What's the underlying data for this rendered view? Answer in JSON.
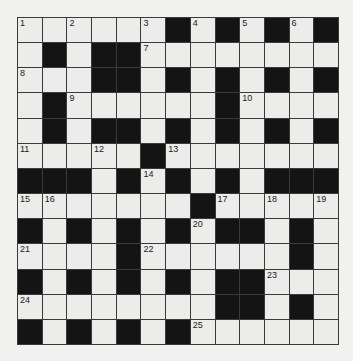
{
  "puzzle": {
    "rows": 13,
    "cols": 13,
    "colors": {
      "white": "#ececea",
      "black": "#141414",
      "line": "#3a3a3a",
      "background": "#f1f1ef"
    },
    "layout": [
      "WWWWWWBWBWBWB",
      "WBWBBWWWWWWWW",
      "WWWBBWBWBWBWB",
      "WBWWWWWWBWWWW",
      "WBWBBWBWBWBWB",
      "WWWWWBWWWWWWW",
      "BBBWBWBWBWBBB",
      "WWWWWWWBWWWWW",
      "BWBWBWBWBBWBW",
      "WWWWBWWWWWWBW",
      "BWBWBWBWBBWWW",
      "WWWWWWWWBBWBW",
      "BWBWBWBWWWWWW"
    ],
    "numbers": [
      {
        "r": 0,
        "c": 0,
        "n": "1"
      },
      {
        "r": 0,
        "c": 2,
        "n": "2"
      },
      {
        "r": 0,
        "c": 5,
        "n": "3"
      },
      {
        "r": 0,
        "c": 7,
        "n": "4"
      },
      {
        "r": 0,
        "c": 9,
        "n": "5"
      },
      {
        "r": 0,
        "c": 11,
        "n": "6"
      },
      {
        "r": 1,
        "c": 5,
        "n": "7"
      },
      {
        "r": 2,
        "c": 0,
        "n": "8"
      },
      {
        "r": 3,
        "c": 2,
        "n": "9"
      },
      {
        "r": 3,
        "c": 9,
        "n": "10"
      },
      {
        "r": 5,
        "c": 0,
        "n": "11"
      },
      {
        "r": 5,
        "c": 3,
        "n": "12"
      },
      {
        "r": 5,
        "c": 6,
        "n": "13"
      },
      {
        "r": 6,
        "c": 5,
        "n": "14"
      },
      {
        "r": 7,
        "c": 0,
        "n": "15"
      },
      {
        "r": 7,
        "c": 1,
        "n": "16"
      },
      {
        "r": 7,
        "c": 8,
        "n": "17"
      },
      {
        "r": 7,
        "c": 10,
        "n": "18"
      },
      {
        "r": 7,
        "c": 12,
        "n": "19"
      },
      {
        "r": 8,
        "c": 7,
        "n": "20"
      },
      {
        "r": 9,
        "c": 0,
        "n": "21"
      },
      {
        "r": 9,
        "c": 5,
        "n": "22"
      },
      {
        "r": 10,
        "c": 10,
        "n": "23"
      },
      {
        "r": 11,
        "c": 0,
        "n": "24"
      },
      {
        "r": 12,
        "c": 7,
        "n": "25"
      }
    ]
  }
}
